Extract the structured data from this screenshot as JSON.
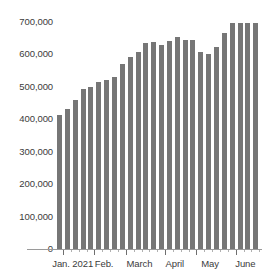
{
  "chart_data": {
    "type": "bar",
    "title": "",
    "xlabel": "",
    "ylabel": "",
    "ylim": [
      0,
      700000
    ],
    "grid": false,
    "legend": null,
    "bar_color": "#767676",
    "y_ticks": [
      {
        "value": 700000,
        "label": "700,000"
      },
      {
        "value": 600000,
        "label": "600,000"
      },
      {
        "value": 500000,
        "label": "500,000"
      },
      {
        "value": 400000,
        "label": "400,000"
      },
      {
        "value": 300000,
        "label": "300,000"
      },
      {
        "value": 200000,
        "label": "200,000"
      },
      {
        "value": 100000,
        "label": "100,000"
      },
      {
        "value": 0,
        "label": "0"
      }
    ],
    "x_tick_labels": [
      "Jan. 2021",
      "Feb.",
      "March",
      "April",
      "May",
      "June"
    ],
    "x_group_starts": [
      0,
      4,
      8,
      13,
      17,
      22
    ],
    "categories": [
      "Jan. 2021 wk1",
      "Jan. 2021 wk2",
      "Jan. 2021 wk3",
      "Jan. 2021 wk4",
      "Feb. wk1",
      "Feb. wk2",
      "Feb. wk3",
      "Feb. wk4",
      "March wk1",
      "March wk2",
      "March wk3",
      "March wk4",
      "March wk5",
      "April wk1",
      "April wk2",
      "April wk3",
      "April wk4",
      "May wk1",
      "May wk2",
      "May wk3",
      "May wk4",
      "May wk5",
      "June wk1",
      "June wk2",
      "June wk3",
      "June wk4"
    ],
    "values": [
      413000,
      432000,
      458000,
      493000,
      500000,
      515000,
      522000,
      529000,
      570000,
      592000,
      608000,
      635000,
      639000,
      628000,
      641000,
      653000,
      645000,
      645000,
      608000,
      600000,
      623000,
      665000,
      697000,
      697000,
      697000,
      697000
    ]
  }
}
